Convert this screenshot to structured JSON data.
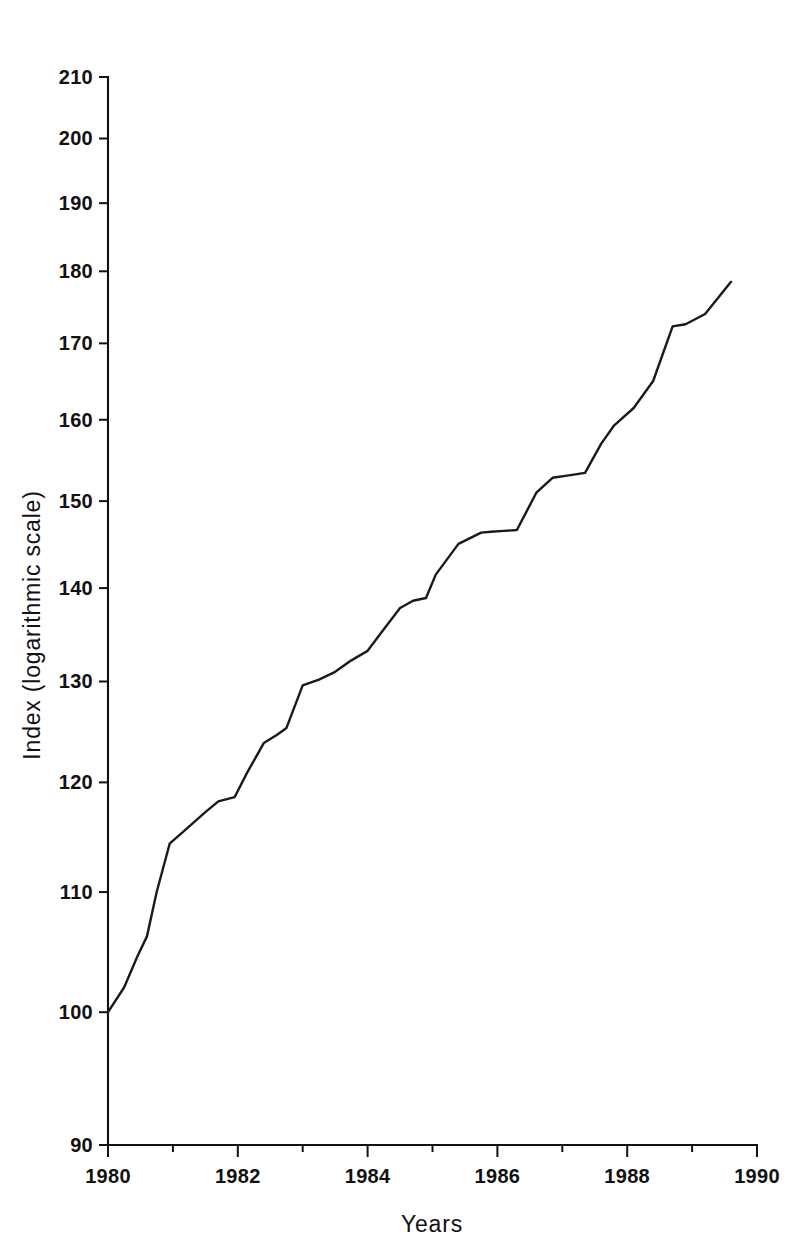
{
  "chart_data": {
    "type": "line",
    "title": "",
    "xlabel": "Years",
    "ylabel": "Index (logarithmic scale)",
    "yscale": "log",
    "xscale": "linear",
    "xlim": [
      1980,
      1990
    ],
    "ylim": [
      90,
      210
    ],
    "grid": false,
    "legend": null,
    "y_ticks": [
      90,
      100,
      110,
      120,
      130,
      140,
      150,
      160,
      170,
      180,
      190,
      200,
      210
    ],
    "y_ticklabels": [
      "90",
      "100",
      "110",
      "120",
      "130",
      "140",
      "150",
      "160",
      "170",
      "180",
      "190",
      "200",
      "210"
    ],
    "x_ticks": [
      1980,
      1982,
      1984,
      1986,
      1988,
      1990
    ],
    "x_ticklabels": [
      "1980",
      "1982",
      "1984",
      "1986",
      "1988",
      "1990"
    ],
    "x_minor_ticks": [
      1981,
      1983,
      1985,
      1987,
      1989
    ],
    "series": [
      {
        "name": "Index",
        "color": "#1a1a1a",
        "x": [
          1980.0,
          1980.25,
          1980.45,
          1980.6,
          1980.75,
          1980.95,
          1981.2,
          1981.5,
          1981.7,
          1981.95,
          1982.15,
          1982.4,
          1982.6,
          1982.75,
          1983.0,
          1983.25,
          1983.5,
          1983.75,
          1984.0,
          1984.25,
          1984.5,
          1984.7,
          1984.9,
          1985.05,
          1985.4,
          1985.75,
          1985.9,
          1986.1,
          1986.3,
          1986.6,
          1986.85,
          1987.1,
          1987.35,
          1987.6,
          1987.8,
          1988.1,
          1988.4,
          1988.7,
          1988.9,
          1989.2,
          1989.6
        ],
        "y": [
          100.0,
          102.0,
          104.5,
          106.2,
          110.0,
          114.3,
          115.6,
          117.2,
          118.2,
          118.6,
          121.0,
          123.8,
          124.6,
          125.3,
          129.6,
          130.2,
          131.0,
          132.2,
          133.2,
          135.5,
          137.8,
          138.6,
          138.9,
          141.5,
          145.0,
          146.3,
          146.4,
          146.5,
          146.6,
          151.0,
          152.8,
          153.1,
          153.4,
          157.0,
          159.3,
          161.5,
          165.0,
          172.3,
          172.6,
          174.0,
          178.5
        ],
        "y_extra_note": "series continues to final point"
      }
    ],
    "data_points_full": {
      "x": [
        1980.0,
        1980.25,
        1980.45,
        1980.6,
        1980.75,
        1980.95,
        1981.2,
        1981.5,
        1981.7,
        1981.95,
        1982.15,
        1982.4,
        1982.6,
        1982.75,
        1983.0,
        1983.25,
        1983.5,
        1983.75,
        1984.0,
        1984.25,
        1984.5,
        1984.7,
        1984.9,
        1985.05,
        1985.4,
        1985.75,
        1985.9,
        1986.1,
        1986.3,
        1986.6,
        1986.85,
        1987.1,
        1987.35,
        1987.6,
        1987.8,
        1988.1,
        1988.4,
        1988.7,
        1988.9,
        1989.2,
        1989.6
      ],
      "y": [
        100.0,
        102.0,
        104.5,
        106.2,
        110.0,
        114.3,
        115.6,
        117.2,
        118.2,
        118.6,
        121.0,
        123.8,
        124.6,
        125.3,
        129.6,
        130.2,
        131.0,
        132.2,
        133.2,
        135.5,
        137.8,
        138.6,
        138.9,
        141.5,
        145.0,
        146.3,
        146.4,
        146.5,
        146.6,
        151.0,
        152.8,
        153.1,
        153.4,
        157.0,
        159.3,
        161.5,
        165.0,
        172.3,
        172.6,
        174.0,
        178.5
      ]
    }
  },
  "axes": {
    "ylabel": "Index (logarithmic scale)",
    "xlabel": "Years"
  }
}
